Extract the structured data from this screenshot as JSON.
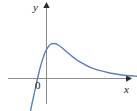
{
  "figure": {
    "background_color": "#ffffff",
    "width": 137,
    "height": 111
  },
  "axes": {
    "x_axis": {
      "label": "x",
      "icon": "arrow-right-icon",
      "color": "#8c8c8c",
      "start_px": [
        8,
        78
      ],
      "end_px": [
        130,
        78
      ],
      "arrow": true
    },
    "y_axis": {
      "label": "y",
      "icon": "arrow-up-icon",
      "color": "#8c8c8c",
      "start_px": [
        46,
        103
      ],
      "end_px": [
        46,
        3
      ],
      "arrow": true
    },
    "origin": {
      "label": "0",
      "position_px": [
        40,
        86
      ]
    }
  },
  "curve": {
    "color": "#5d80b6",
    "stroke_width": 1.4,
    "description": "Steeply increasing from lower left, crossing the x-axis, rising to a rounded maximum just right of the y-axis, then decreasing and approaching the x-axis asymptotically on the right."
  },
  "chart_data": {
    "type": "line",
    "title": "",
    "subtitle": "",
    "xlabel": "x",
    "ylabel": "y",
    "grid": false,
    "legend": null,
    "axis_arrows": true,
    "origin_label": "0",
    "xlim": [
      -1.35,
      5.2
    ],
    "ylim": [
      -1.6,
      2.45
    ],
    "tick_labels": {
      "x": [],
      "y": []
    },
    "annotations": [],
    "series": [
      {
        "name": "curve",
        "color": "#5d80b6",
        "x": [
          -0.92,
          -0.85,
          -0.8,
          -0.74,
          -0.68,
          -0.62,
          -0.56,
          -0.5,
          -0.42,
          -0.34,
          -0.26,
          -0.18,
          -0.1,
          -0.02,
          0.06,
          0.14,
          0.22,
          0.3,
          0.4,
          0.5,
          0.62,
          0.74,
          0.88,
          1.04,
          1.2,
          1.4,
          1.6,
          1.85,
          2.1,
          2.4,
          2.7,
          3.0,
          3.35,
          3.7,
          4.05,
          4.4,
          4.75,
          5.05
        ],
        "y": [
          -1.44,
          -1.2,
          -1.02,
          -0.82,
          -0.62,
          -0.42,
          -0.22,
          -0.03,
          0.22,
          0.45,
          0.65,
          0.83,
          0.99,
          1.12,
          1.22,
          1.3,
          1.35,
          1.38,
          1.39,
          1.38,
          1.34,
          1.28,
          1.2,
          1.1,
          1.0,
          0.88,
          0.77,
          0.65,
          0.55,
          0.44,
          0.36,
          0.3,
          0.24,
          0.19,
          0.15,
          0.12,
          0.1,
          0.08
        ],
        "x_axis_crossing": -0.49,
        "maximum": {
          "x": 0.36,
          "y": 1.39
        },
        "asymptote": {
          "type": "horizontal",
          "y": 0.0
        }
      }
    ]
  }
}
